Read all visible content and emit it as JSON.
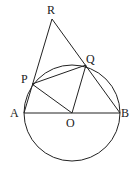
{
  "diagram": {
    "type": "geometry",
    "circle": {
      "center": "O",
      "cx": 72,
      "cy": 113,
      "r": 48
    },
    "points": {
      "R": {
        "x": 52,
        "y": 19,
        "label": "R",
        "lx": 47,
        "ly": 14
      },
      "P": {
        "x": 32,
        "y": 84,
        "label": "P",
        "lx": 21,
        "ly": 83
      },
      "Q": {
        "x": 86,
        "y": 65,
        "label": "Q",
        "lx": 86,
        "ly": 63
      },
      "A": {
        "x": 24,
        "y": 113,
        "label": "A",
        "lx": 10,
        "ly": 117
      },
      "O": {
        "x": 72,
        "y": 113,
        "label": "O",
        "lx": 66,
        "ly": 127
      },
      "B": {
        "x": 120,
        "y": 113,
        "label": "B",
        "lx": 121,
        "ly": 117
      }
    },
    "segments": [
      [
        "A",
        "R"
      ],
      [
        "R",
        "B"
      ],
      [
        "A",
        "B"
      ],
      [
        "P",
        "Q"
      ],
      [
        "P",
        "O"
      ],
      [
        "O",
        "Q"
      ]
    ],
    "colors": {
      "stroke": "#222222",
      "background": "#ffffff"
    }
  }
}
